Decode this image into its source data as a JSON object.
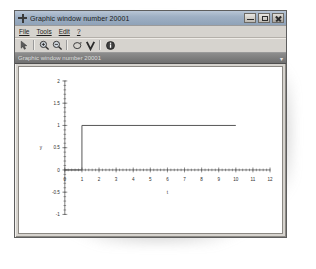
{
  "window": {
    "title": "Graphic window number 20001",
    "icon": "scilab-cross-icon",
    "buttons": {
      "minimize": "minimize-button",
      "maximize": "maximize-button",
      "close": "close-button"
    }
  },
  "menubar": {
    "items": [
      {
        "label": "File",
        "mnemonic": "F"
      },
      {
        "label": "Tools",
        "mnemonic": "T"
      },
      {
        "label": "Edit",
        "mnemonic": "E"
      },
      {
        "label": "?",
        "mnemonic": "?"
      }
    ]
  },
  "toolbar": {
    "buttons": [
      {
        "name": "pointer-select-icon",
        "tooltip": "Select"
      },
      {
        "name": "zoom-in-icon",
        "tooltip": "Zoom in"
      },
      {
        "name": "zoom-out-icon",
        "tooltip": "Zoom out"
      },
      {
        "name": "rotate-3d-icon",
        "tooltip": "3D Rotation"
      },
      {
        "name": "datatip-icon",
        "tooltip": "Data tip"
      },
      {
        "name": "info-icon",
        "tooltip": "About"
      }
    ]
  },
  "tabstrip": {
    "label": "Graphic window number 20001",
    "pin": "▾"
  },
  "chart_data": {
    "type": "line",
    "title": "",
    "xlabel": "t",
    "ylabel": "y",
    "xlim": [
      0,
      12
    ],
    "ylim": [
      -1,
      2
    ],
    "xticks": [
      0,
      1,
      2,
      3,
      4,
      5,
      6,
      7,
      8,
      9,
      10,
      11,
      12
    ],
    "xticklabels": [
      "0",
      "1",
      "2",
      "3",
      "4",
      "5",
      "6",
      "7",
      "8",
      "9",
      "10",
      "11",
      "12"
    ],
    "yticks": [
      -1,
      -0.5,
      0,
      0.5,
      1,
      1.5,
      2
    ],
    "yticklabels": [
      "-1",
      "-0.5",
      "0",
      "0.5",
      "1",
      "1.5",
      "2"
    ],
    "grid": false,
    "legend": null,
    "series": [
      {
        "name": "step response",
        "color": "#555555",
        "x": [
          0,
          1,
          1,
          10
        ],
        "y": [
          0,
          0,
          1,
          1
        ]
      }
    ]
  }
}
